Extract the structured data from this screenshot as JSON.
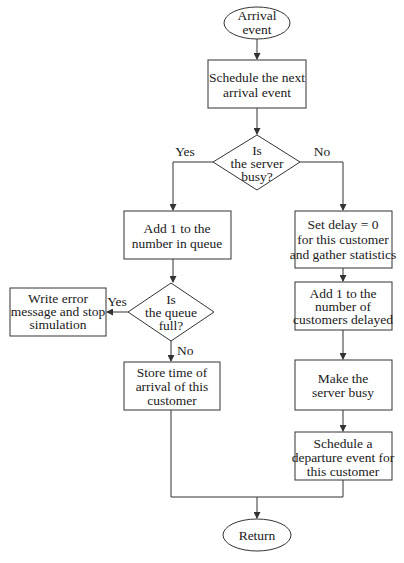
{
  "diagram": {
    "type": "flowchart",
    "nodes": {
      "start": {
        "shape": "ellipse",
        "lines": [
          "Arrival",
          "event"
        ]
      },
      "schedule_next": {
        "shape": "rect",
        "lines": [
          "Schedule the next",
          "arrival event"
        ]
      },
      "server_busy": {
        "shape": "diamond",
        "lines": [
          "Is",
          "the server",
          "busy?"
        ]
      },
      "add_queue": {
        "shape": "rect",
        "lines": [
          "Add 1 to the",
          "number in queue"
        ]
      },
      "queue_full": {
        "shape": "diamond",
        "lines": [
          "Is",
          "the queue",
          "full?"
        ]
      },
      "error": {
        "shape": "rect",
        "lines": [
          "Write error",
          "message and stop",
          "simulation"
        ]
      },
      "store_time": {
        "shape": "rect",
        "lines": [
          "Store time of",
          "arrival of this",
          "customer"
        ]
      },
      "set_delay": {
        "shape": "rect",
        "lines": [
          "Set delay = 0",
          "for this customer",
          "and gather statistics"
        ]
      },
      "add_delayed": {
        "shape": "rect",
        "lines": [
          "Add 1 to the",
          "number of",
          "customers delayed"
        ]
      },
      "make_busy": {
        "shape": "rect",
        "lines": [
          "Make the",
          "server busy"
        ]
      },
      "schedule_departure": {
        "shape": "rect",
        "lines": [
          "Schedule a",
          "departure event for",
          "this customer"
        ]
      },
      "end": {
        "shape": "ellipse",
        "lines": [
          "Return"
        ]
      }
    },
    "edge_labels": {
      "server_busy_yes": "Yes",
      "server_busy_no": "No",
      "queue_full_yes": "Yes",
      "queue_full_no": "No"
    },
    "edges": [
      {
        "from": "start",
        "to": "schedule_next"
      },
      {
        "from": "schedule_next",
        "to": "server_busy"
      },
      {
        "from": "server_busy",
        "to": "add_queue",
        "label": "Yes"
      },
      {
        "from": "server_busy",
        "to": "set_delay",
        "label": "No"
      },
      {
        "from": "add_queue",
        "to": "queue_full"
      },
      {
        "from": "queue_full",
        "to": "error",
        "label": "Yes"
      },
      {
        "from": "queue_full",
        "to": "store_time",
        "label": "No"
      },
      {
        "from": "set_delay",
        "to": "add_delayed"
      },
      {
        "from": "add_delayed",
        "to": "make_busy"
      },
      {
        "from": "make_busy",
        "to": "schedule_departure"
      },
      {
        "from": "store_time",
        "to": "end"
      },
      {
        "from": "schedule_departure",
        "to": "end"
      }
    ],
    "colors": {
      "stroke": "#333333",
      "fill": "#ffffff",
      "text": "#1a1a1a",
      "background": "#ffffff"
    }
  }
}
